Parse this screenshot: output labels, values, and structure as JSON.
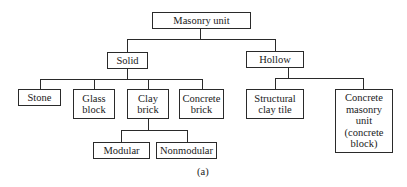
{
  "diagram": {
    "root": {
      "label": "Masonry unit"
    },
    "categories": [
      {
        "label": "Solid"
      },
      {
        "label": "Hollow"
      }
    ],
    "solid_children": [
      {
        "label": "Stone"
      },
      {
        "label": "Glass\nblock"
      },
      {
        "label": "Clay\nbrick"
      },
      {
        "label": "Concrete\nbrick"
      }
    ],
    "hollow_children": [
      {
        "label": "Structural\nclay tile"
      },
      {
        "label": "Concrete\nmasonry\nunit\n(concrete\nblock)"
      }
    ],
    "clay_brick_children": [
      {
        "label": "Modular"
      },
      {
        "label": "Nonmodular"
      }
    ],
    "caption": "(a)"
  }
}
